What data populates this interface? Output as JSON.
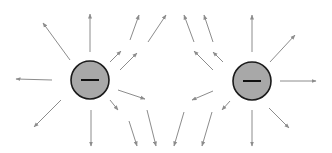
{
  "diagram": {
    "colors": {
      "background": "#ffffff",
      "arrow": "#8c8c8c",
      "charge_fill": "#a8a8a8",
      "charge_stroke": "#1a1a1a",
      "sign": "#111111"
    },
    "charges": [
      {
        "id": "left",
        "cx": 90,
        "cy": 80,
        "r": 19,
        "sign": "−"
      },
      {
        "id": "right",
        "cx": 252,
        "cy": 81,
        "r": 19,
        "sign": "−"
      }
    ],
    "arrows": [
      {
        "x1": 90,
        "y1": 52,
        "x2": 90,
        "y2": 14
      },
      {
        "x1": 70,
        "y1": 60,
        "x2": 43,
        "y2": 23
      },
      {
        "x1": 52,
        "y1": 80,
        "x2": 16,
        "y2": 79
      },
      {
        "x1": 61,
        "y1": 100,
        "x2": 34,
        "y2": 127
      },
      {
        "x1": 91,
        "y1": 110,
        "x2": 91,
        "y2": 146
      },
      {
        "x1": 110,
        "y1": 62,
        "x2": 121,
        "y2": 51
      },
      {
        "x1": 120,
        "y1": 70,
        "x2": 137,
        "y2": 53
      },
      {
        "x1": 130,
        "y1": 40,
        "x2": 139,
        "y2": 15
      },
      {
        "x1": 148,
        "y1": 42,
        "x2": 166,
        "y2": 15
      },
      {
        "x1": 118,
        "y1": 90,
        "x2": 145,
        "y2": 99
      },
      {
        "x1": 110,
        "y1": 100,
        "x2": 118,
        "y2": 110
      },
      {
        "x1": 129,
        "y1": 121,
        "x2": 137,
        "y2": 146
      },
      {
        "x1": 147,
        "y1": 110,
        "x2": 156,
        "y2": 146
      },
      {
        "x1": 252,
        "y1": 52,
        "x2": 252,
        "y2": 15
      },
      {
        "x1": 270,
        "y1": 62,
        "x2": 295,
        "y2": 35
      },
      {
        "x1": 280,
        "y1": 81,
        "x2": 316,
        "y2": 81
      },
      {
        "x1": 269,
        "y1": 108,
        "x2": 289,
        "y2": 128
      },
      {
        "x1": 252,
        "y1": 110,
        "x2": 252,
        "y2": 146
      },
      {
        "x1": 194,
        "y1": 42,
        "x2": 184,
        "y2": 15
      },
      {
        "x1": 213,
        "y1": 42,
        "x2": 204,
        "y2": 15
      },
      {
        "x1": 213,
        "y1": 70,
        "x2": 194,
        "y2": 51
      },
      {
        "x1": 223,
        "y1": 62,
        "x2": 213,
        "y2": 52
      },
      {
        "x1": 213,
        "y1": 91,
        "x2": 192,
        "y2": 100
      },
      {
        "x1": 230,
        "y1": 101,
        "x2": 222,
        "y2": 110
      },
      {
        "x1": 184,
        "y1": 112,
        "x2": 174,
        "y2": 146
      },
      {
        "x1": 212,
        "y1": 112,
        "x2": 202,
        "y2": 146
      }
    ]
  }
}
